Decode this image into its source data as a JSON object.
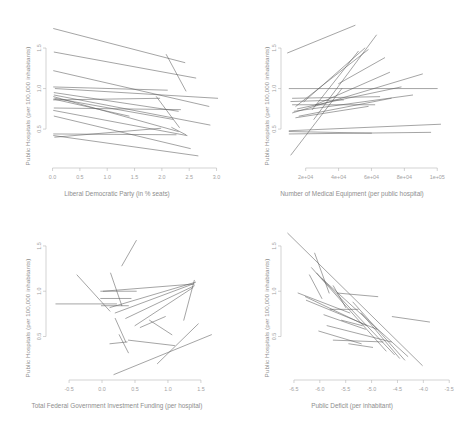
{
  "figure": {
    "type": "multi-panel-spaghetti-plot",
    "panels": 4,
    "layout": "2x2",
    "shared_ylabel": "Public Hospitals (per 100,000 inhabitants)"
  },
  "chart_data": [
    {
      "id": "top-left",
      "type": "line",
      "title": "",
      "xlabel": "Liberal Democratic Party (in % seats)",
      "ylabel": "Public Hospitals (per 100,000 inhabitants)",
      "xlim": [
        -0.12,
        3.1
      ],
      "ylim": [
        0.02,
        1.92
      ],
      "xticks": [
        "0.0",
        "0.5",
        "1.0",
        "1.5",
        "2.0",
        "2.5",
        "3.0"
      ],
      "xtickvals": [
        0.0,
        0.5,
        1.0,
        1.5,
        2.0,
        2.5,
        3.0
      ],
      "yticks": [
        "0.5",
        "1.0",
        "1.5"
      ],
      "ytickvals": [
        0.5,
        1.0,
        1.5
      ],
      "grid": false,
      "legend": "none",
      "series": [
        {
          "name": "s1",
          "x": [
            0.02,
            2.42
          ],
          "y": [
            1.74,
            1.32
          ]
        },
        {
          "name": "s2",
          "x": [
            2.08,
            2.44
          ],
          "y": [
            1.42,
            0.97
          ]
        },
        {
          "name": "s3",
          "x": [
            0.03,
            2.62
          ],
          "y": [
            1.45,
            1.13
          ]
        },
        {
          "name": "s4",
          "x": [
            0.02,
            2.86
          ],
          "y": [
            1.22,
            0.78
          ]
        },
        {
          "name": "s5",
          "x": [
            0.02,
            2.1
          ],
          "y": [
            1.02,
            0.98
          ]
        },
        {
          "name": "s6",
          "x": [
            0.05,
            3.02
          ],
          "y": [
            1.0,
            0.88
          ]
        },
        {
          "name": "s7",
          "x": [
            0.03,
            2.3
          ],
          "y": [
            0.95,
            0.72
          ]
        },
        {
          "name": "s8",
          "x": [
            0.03,
            2.88
          ],
          "y": [
            0.92,
            0.55
          ]
        },
        {
          "name": "s9",
          "x": [
            0.02,
            2.3
          ],
          "y": [
            0.9,
            0.47
          ]
        },
        {
          "name": "s10",
          "x": [
            0.04,
            2.2
          ],
          "y": [
            0.88,
            0.62
          ]
        },
        {
          "name": "s11",
          "x": [
            0.02,
            1.96
          ],
          "y": [
            0.86,
            0.88
          ]
        },
        {
          "name": "s12",
          "x": [
            0.03,
            2.34
          ],
          "y": [
            0.76,
            0.74
          ]
        },
        {
          "name": "s13",
          "x": [
            0.02,
            2.46
          ],
          "y": [
            0.73,
            0.42
          ]
        },
        {
          "name": "s14",
          "x": [
            0.03,
            2.52
          ],
          "y": [
            0.66,
            0.26
          ]
        },
        {
          "name": "s15",
          "x": [
            0.02,
            2.26
          ],
          "y": [
            0.44,
            0.43
          ]
        },
        {
          "name": "s16",
          "x": [
            0.02,
            2.66
          ],
          "y": [
            0.42,
            0.17
          ]
        },
        {
          "name": "s17",
          "x": [
            0.04,
            1.98
          ],
          "y": [
            0.4,
            0.51
          ]
        },
        {
          "name": "s18",
          "x": [
            2.18,
            2.44
          ],
          "y": [
            0.52,
            0.43
          ]
        },
        {
          "name": "s19",
          "x": [
            1.9,
            2.32
          ],
          "y": [
            0.9,
            0.52
          ]
        },
        {
          "name": "s20",
          "x": [
            0.02,
            1.4
          ],
          "y": [
            0.87,
            0.66
          ]
        }
      ]
    },
    {
      "id": "top-right",
      "type": "line",
      "title": "",
      "xlabel": "Number of Medical Equipment (per public hospital)",
      "ylabel": "Public Hospitals (per 100,000 inhabitants)",
      "xlim": [
        5000,
        112000
      ],
      "ylim": [
        0.02,
        1.92
      ],
      "xticks": [
        "2e+04",
        "4e+04",
        "6e+04",
        "8e+04",
        "1e+05"
      ],
      "xtickvals": [
        20000,
        40000,
        60000,
        80000,
        100000
      ],
      "yticks": [
        "0.5",
        "1.0",
        "1.5"
      ],
      "ytickvals": [
        0.5,
        1.0,
        1.5
      ],
      "grid": false,
      "legend": "none",
      "series": [
        {
          "name": "s1",
          "x": [
            9000,
            50000
          ],
          "y": [
            1.44,
            1.78
          ]
        },
        {
          "name": "s2",
          "x": [
            25000,
            63000
          ],
          "y": [
            0.62,
            1.66
          ]
        },
        {
          "name": "s3",
          "x": [
            19000,
            56000
          ],
          "y": [
            0.84,
            1.5
          ]
        },
        {
          "name": "s4",
          "x": [
            14000,
            58000
          ],
          "y": [
            0.78,
            1.48
          ]
        },
        {
          "name": "s5",
          "x": [
            24000,
            52000
          ],
          "y": [
            0.74,
            1.46
          ]
        },
        {
          "name": "s6",
          "x": [
            40000,
            68000
          ],
          "y": [
            1.06,
            1.38
          ]
        },
        {
          "name": "s7",
          "x": [
            26000,
            71000
          ],
          "y": [
            0.8,
            1.2
          ]
        },
        {
          "name": "s8",
          "x": [
            12000,
            91000
          ],
          "y": [
            0.7,
            1.18
          ]
        },
        {
          "name": "s9",
          "x": [
            10000,
            100000
          ],
          "y": [
            1.0,
            1.0
          ]
        },
        {
          "name": "s10",
          "x": [
            15000,
            78000
          ],
          "y": [
            0.75,
            1.02
          ]
        },
        {
          "name": "s11",
          "x": [
            13000,
            85000
          ],
          "y": [
            0.72,
            0.92
          ]
        },
        {
          "name": "s12",
          "x": [
            12000,
            65000
          ],
          "y": [
            0.88,
            0.9
          ]
        },
        {
          "name": "s13",
          "x": [
            16000,
            72000
          ],
          "y": [
            0.66,
            0.88
          ]
        },
        {
          "name": "s14",
          "x": [
            11000,
            43000
          ],
          "y": [
            0.84,
            0.86
          ]
        },
        {
          "name": "s15",
          "x": [
            12000,
            62000
          ],
          "y": [
            0.8,
            0.8
          ]
        },
        {
          "name": "s16",
          "x": [
            14000,
            58000
          ],
          "y": [
            0.64,
            0.78
          ]
        },
        {
          "name": "s17",
          "x": [
            10000,
            102000
          ],
          "y": [
            0.48,
            0.56
          ]
        },
        {
          "name": "s18",
          "x": [
            10000,
            96000
          ],
          "y": [
            0.44,
            0.46
          ]
        },
        {
          "name": "s19",
          "x": [
            10000,
            60000
          ],
          "y": [
            0.47,
            0.45
          ]
        },
        {
          "name": "s20",
          "x": [
            11000,
            42000
          ],
          "y": [
            0.18,
            1.0
          ]
        }
      ]
    },
    {
      "id": "bottom-left",
      "type": "line",
      "title": "",
      "xlabel": "Total Federal Government Investment Funding (per hospital)",
      "ylabel": "Public Hospitals (per 100,000 inhabitants)",
      "xlim": [
        -0.85,
        1.82
      ],
      "ylim": [
        0.02,
        1.72
      ],
      "xticks": [
        "-0.5",
        "0.0",
        "0.5",
        "1.0",
        "1.5"
      ],
      "xtickvals": [
        -0.5,
        0.0,
        0.5,
        1.0,
        1.5
      ],
      "yticks": [
        "0.5",
        "1.0",
        "1.5"
      ],
      "ytickvals": [
        0.5,
        1.0,
        1.5
      ],
      "grid": false,
      "legend": "none",
      "series": [
        {
          "name": "s1",
          "x": [
            0.3,
            0.52
          ],
          "y": [
            1.28,
            1.56
          ]
        },
        {
          "name": "s2",
          "x": [
            0.13,
            0.3
          ],
          "y": [
            1.2,
            0.84
          ]
        },
        {
          "name": "s3",
          "x": [
            -0.38,
            0.12
          ],
          "y": [
            1.18,
            0.78
          ]
        },
        {
          "name": "s4",
          "x": [
            1.24,
            1.4
          ],
          "y": [
            0.68,
            1.12
          ]
        },
        {
          "name": "s5",
          "x": [
            0.02,
            1.4
          ],
          "y": [
            1.0,
            1.08
          ]
        },
        {
          "name": "s6",
          "x": [
            -0.02,
            0.52
          ],
          "y": [
            1.0,
            1.0
          ]
        },
        {
          "name": "s7",
          "x": [
            -0.02,
            0.44
          ],
          "y": [
            0.92,
            0.92
          ]
        },
        {
          "name": "s8",
          "x": [
            -0.7,
            0.22
          ],
          "y": [
            0.86,
            0.86
          ]
        },
        {
          "name": "s9",
          "x": [
            -0.01,
            0.4
          ],
          "y": [
            0.84,
            0.84
          ]
        },
        {
          "name": "s10",
          "x": [
            0.12,
            1.42
          ],
          "y": [
            0.82,
            1.1
          ]
        },
        {
          "name": "s11",
          "x": [
            0.2,
            1.38
          ],
          "y": [
            0.76,
            1.08
          ]
        },
        {
          "name": "s12",
          "x": [
            0.36,
            1.4
          ],
          "y": [
            0.7,
            1.06
          ]
        },
        {
          "name": "s13",
          "x": [
            0.5,
            1.38
          ],
          "y": [
            0.62,
            1.04
          ]
        },
        {
          "name": "s14",
          "x": [
            0.58,
            0.96
          ],
          "y": [
            0.6,
            0.72
          ]
        },
        {
          "name": "s15",
          "x": [
            0.72,
            1.06
          ],
          "y": [
            0.68,
            0.52
          ]
        },
        {
          "name": "s16",
          "x": [
            0.2,
            0.36
          ],
          "y": [
            0.7,
            0.44
          ]
        },
        {
          "name": "s17",
          "x": [
            0.12,
            0.38
          ],
          "y": [
            0.42,
            0.44
          ]
        },
        {
          "name": "s18",
          "x": [
            0.4,
            1.1
          ],
          "y": [
            0.46,
            0.4
          ]
        },
        {
          "name": "s19",
          "x": [
            0.84,
            1.46
          ],
          "y": [
            0.2,
            0.64
          ]
        },
        {
          "name": "s20",
          "x": [
            0.18,
            1.66
          ],
          "y": [
            0.08,
            0.52
          ]
        },
        {
          "name": "s21",
          "x": [
            0.26,
            0.4
          ],
          "y": [
            0.52,
            0.32
          ]
        }
      ]
    },
    {
      "id": "bottom-right",
      "type": "line",
      "title": "",
      "xlabel": "Public Deficit (per inhabitant)",
      "ylabel": "Public Hospitals (per 100,000 inhabitants)",
      "xlim": [
        -6.75,
        -3.35
      ],
      "ylim": [
        0.02,
        1.72
      ],
      "xticks": [
        "-6.5",
        "-6.0",
        "-5.5",
        "-5.0",
        "-4.5",
        "-4.0",
        "-3.5"
      ],
      "xtickvals": [
        -6.5,
        -6.0,
        -5.5,
        -5.0,
        -4.5,
        -4.0,
        -3.5
      ],
      "yticks": [
        "0.5",
        "1.0",
        "1.5"
      ],
      "ytickvals": [
        0.5,
        1.0,
        1.5
      ],
      "grid": false,
      "legend": "none",
      "series": [
        {
          "name": "s1",
          "x": [
            -6.62,
            -4.02
          ],
          "y": [
            1.64,
            0.18
          ]
        },
        {
          "name": "s2",
          "x": [
            -6.1,
            -5.82
          ],
          "y": [
            1.42,
            0.98
          ]
        },
        {
          "name": "s3",
          "x": [
            -6.2,
            -5.96
          ],
          "y": [
            1.18,
            0.92
          ]
        },
        {
          "name": "s4",
          "x": [
            -6.16,
            -4.72
          ],
          "y": [
            1.26,
            0.34
          ]
        },
        {
          "name": "s5",
          "x": [
            -6.06,
            -4.56
          ],
          "y": [
            1.2,
            0.3
          ]
        },
        {
          "name": "s6",
          "x": [
            -5.96,
            -4.3
          ],
          "y": [
            1.14,
            0.28
          ]
        },
        {
          "name": "s7",
          "x": [
            -5.74,
            -5.5
          ],
          "y": [
            1.06,
            0.82
          ]
        },
        {
          "name": "s8",
          "x": [
            -6.42,
            -5.42
          ],
          "y": [
            0.98,
            0.76
          ]
        },
        {
          "name": "s9",
          "x": [
            -6.28,
            -5.1
          ],
          "y": [
            0.94,
            0.62
          ]
        },
        {
          "name": "s10",
          "x": [
            -6.26,
            -4.9
          ],
          "y": [
            0.9,
            0.58
          ]
        },
        {
          "name": "s11",
          "x": [
            -5.66,
            -4.88
          ],
          "y": [
            0.98,
            0.94
          ]
        },
        {
          "name": "s12",
          "x": [
            -5.8,
            -5.26
          ],
          "y": [
            0.8,
            0.8
          ]
        },
        {
          "name": "s13",
          "x": [
            -4.6,
            -3.88
          ],
          "y": [
            0.72,
            0.66
          ]
        },
        {
          "name": "s14",
          "x": [
            -5.92,
            -5.12
          ],
          "y": [
            0.74,
            0.58
          ]
        },
        {
          "name": "s15",
          "x": [
            -5.58,
            -5.18
          ],
          "y": [
            0.68,
            0.62
          ]
        },
        {
          "name": "s16",
          "x": [
            -5.86,
            -4.62
          ],
          "y": [
            0.62,
            0.44
          ]
        },
        {
          "name": "s17",
          "x": [
            -6.02,
            -5.2
          ],
          "y": [
            0.56,
            0.42
          ]
        },
        {
          "name": "s18",
          "x": [
            -5.74,
            -4.78
          ],
          "y": [
            0.46,
            0.44
          ]
        },
        {
          "name": "s19",
          "x": [
            -5.44,
            -4.98
          ],
          "y": [
            0.42,
            0.38
          ]
        },
        {
          "name": "s20",
          "x": [
            -5.36,
            -4.36
          ],
          "y": [
            0.88,
            0.24
          ]
        },
        {
          "name": "s21",
          "x": [
            -5.2,
            -4.46
          ],
          "y": [
            0.76,
            0.26
          ]
        }
      ]
    }
  ]
}
